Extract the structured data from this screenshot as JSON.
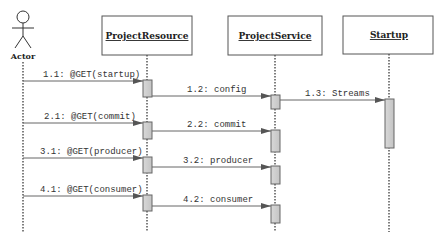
{
  "diagram": {
    "type": "sequence",
    "actor": {
      "label": "Actor"
    },
    "objects": [
      {
        "id": "pr",
        "label": "ProjectResource"
      },
      {
        "id": "ps",
        "label": "ProjectService"
      },
      {
        "id": "st",
        "label": "Startup"
      }
    ],
    "messages": [
      {
        "label": "1.1: @GET(startup)",
        "from": "Actor",
        "to": "ProjectResource"
      },
      {
        "label": "1.2: config",
        "from": "ProjectResource",
        "to": "ProjectService"
      },
      {
        "label": "1.3: Streams",
        "from": "ProjectService",
        "to": "Startup"
      },
      {
        "label": "2.1: @GET(commit)",
        "from": "Actor",
        "to": "ProjectResource"
      },
      {
        "label": "2.2: commit",
        "from": "ProjectResource",
        "to": "ProjectService"
      },
      {
        "label": "3.1: @GET(producer)",
        "from": "Actor",
        "to": "ProjectResource"
      },
      {
        "label": "3.2: producer",
        "from": "ProjectResource",
        "to": "ProjectService"
      },
      {
        "label": "4.1: @GET(consumer)",
        "from": "Actor",
        "to": "ProjectResource"
      },
      {
        "label": "4.2: consumer",
        "from": "ProjectResource",
        "to": "ProjectService"
      }
    ]
  }
}
